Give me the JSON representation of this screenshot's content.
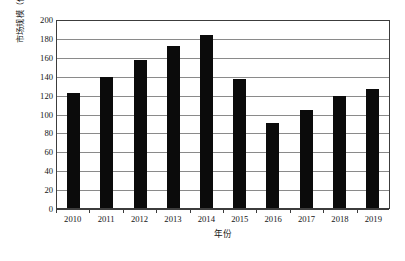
{
  "chart_data": {
    "type": "bar",
    "title": "",
    "subtitle": "",
    "xlabel": "年份",
    "ylabel": "市场规模（亿美元）",
    "categories": [
      "2010",
      "2011",
      "2012",
      "2013",
      "2014",
      "2015",
      "2016",
      "2017",
      "2018",
      "2019"
    ],
    "values": [
      122,
      139,
      157,
      171,
      183,
      137,
      90,
      104,
      119,
      126
    ],
    "series": [
      {
        "name": "市场规模",
        "values": [
          122,
          139,
          157,
          171,
          183,
          137,
          90,
          104,
          119,
          126
        ]
      }
    ],
    "ylim": [
      0,
      200
    ],
    "y_ticks": [
      0,
      20,
      40,
      60,
      80,
      100,
      120,
      140,
      160,
      180,
      200
    ],
    "y_tick_labels": [
      "0",
      "20",
      "40",
      "60",
      "80",
      "100",
      "120",
      "140",
      "160",
      "180",
      "200"
    ],
    "x_tick_labels": [
      "2010",
      "2011",
      "2012",
      "2013",
      "2014",
      "2015",
      "2016",
      "2017",
      "2018",
      "2019"
    ],
    "grid": true,
    "grid_axis": "y",
    "legend": false,
    "legend_position": "none",
    "bar_color": "#0b0b0b",
    "gridline_color": "#8a8a8a",
    "axis_color": "#3c3c3c",
    "background_color": "#ffffff",
    "annotations": []
  }
}
